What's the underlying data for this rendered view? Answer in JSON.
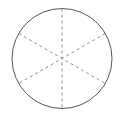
{
  "canvas": {
    "width": 123,
    "height": 122,
    "background_color": "#ffffff"
  },
  "figure": {
    "type": "circle-divided-into-sectors",
    "center": {
      "x": 62,
      "y": 58.5
    },
    "radius": 50,
    "sector_count": 6,
    "sector_angle_deg": 60,
    "outline": {
      "shape": "circle",
      "stroke_color": "#555555",
      "stroke_width": 1,
      "style": "solid",
      "fill": "none"
    },
    "diameters": {
      "count": 3,
      "angles_deg": [
        90,
        30,
        150
      ],
      "stroke_color": "#8f8f8f",
      "stroke_width": 1,
      "style": "dashed",
      "dash_pattern": "3 3"
    }
  }
}
